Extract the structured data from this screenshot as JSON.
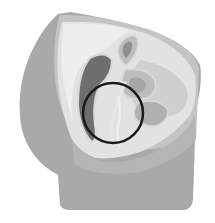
{
  "image": {
    "description": "Grayscale sagittal cross-section illustration of the female pelvis with a black circle highlighting the central region",
    "background": "#ffffff",
    "colors": {
      "outer_body": "#a9a9a9",
      "outer_body_light": "#c4c4c4",
      "inner_cavity": "#e2e2e2",
      "inner_cavity_light": "#eeeeee",
      "organ_mid": "#bdbdbd",
      "organ_dark": "#6e6e6e",
      "organ_light": "#d8d8d8",
      "highlight_circle": "#1a1a1a"
    },
    "highlight_circle": {
      "cx": 113,
      "cy": 113,
      "r": 30,
      "stroke_width": 2.5
    }
  }
}
